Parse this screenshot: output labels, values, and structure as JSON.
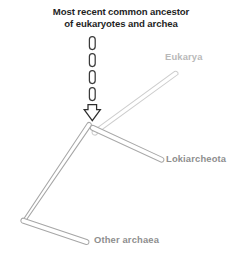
{
  "figure": {
    "type": "phylogenetic-tree-diagram",
    "background_color": "#ffffff",
    "width": 242,
    "height": 257
  },
  "annotation": {
    "caption": "Most recent common ancestor\nof eukaryotes and archea",
    "caption_color": "#1f1f1f",
    "pointer": {
      "kind": "dashed-arrow",
      "direction": "down",
      "dash_count": 4,
      "stroke_color": "#3a3a3a",
      "fill_color": "#ffffff",
      "target": "root-node"
    }
  },
  "tree": {
    "root_node_label": "most-recent-common-ancestor",
    "branches": [
      {
        "id": "eukarya",
        "label": "Eukarya",
        "color": "#cfcfcf",
        "label_color": "#b9b9b9"
      },
      {
        "id": "lokiarcheota",
        "label": "Lokiarcheota",
        "color": "#a8a8a8",
        "label_color": "#8e8e8e"
      },
      {
        "id": "other-archaea",
        "label": "Other archaea",
        "color": "#a0a0a0",
        "label_color": "#8e8e8e"
      }
    ]
  },
  "labels": {
    "eukarya": "Eukarya",
    "lokiarcheota": "Lokiarcheota",
    "other_archaea": "Other archaea"
  }
}
